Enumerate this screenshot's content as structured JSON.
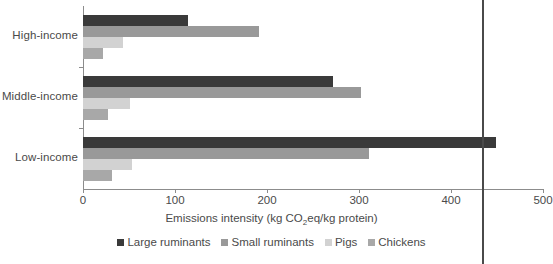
{
  "chart_data": {
    "type": "bar",
    "orientation": "horizontal",
    "title": "",
    "xlabel": "Emissions intensity (kg CO2eq/kg protein)",
    "xlabel_parts": {
      "pre": "Emissions intensity (kg CO",
      "sub": "2",
      "post": "eq/kg protein)"
    },
    "ylabel": "",
    "categories": [
      "High-income",
      "Middle-income",
      "Low-income"
    ],
    "xlim": [
      0,
      500
    ],
    "xticks": [
      0,
      100,
      200,
      300,
      400,
      500
    ],
    "xtick_labels": [
      "0",
      "100",
      "200",
      "300",
      "400",
      "500"
    ],
    "grid": false,
    "legend_position": "bottom",
    "series": [
      {
        "name": "Large ruminants",
        "color": "#3a3a3a",
        "values": [
          114,
          272,
          449
        ]
      },
      {
        "name": "Small ruminants",
        "color": "#999999",
        "values": [
          191,
          302,
          311
        ]
      },
      {
        "name": "Pigs",
        "color": "#d2d2d2",
        "values": [
          44,
          51,
          53
        ]
      },
      {
        "name": "Chickens",
        "color": "#a8a8a8",
        "values": [
          22,
          27,
          31
        ]
      }
    ],
    "annotations": [
      {
        "type": "vertical-rule",
        "name": "page-edge-rule",
        "x_value": 434,
        "color": "#4a4a4a"
      }
    ]
  }
}
